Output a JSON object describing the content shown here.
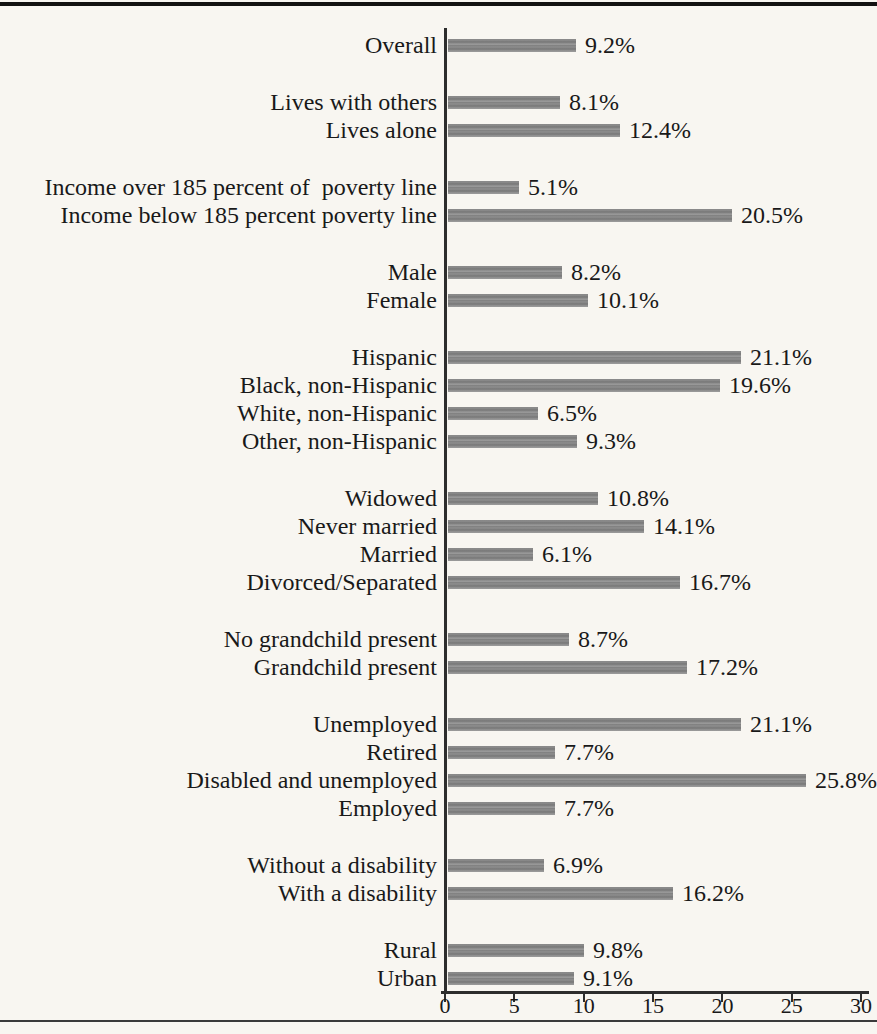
{
  "page": {
    "background_color": "#f8f6f1",
    "text_color": "#191919",
    "has_top_rule": true,
    "has_bottom_rule": true
  },
  "chart_data": {
    "type": "bar",
    "orientation": "horizontal",
    "title": "",
    "xlabel": "",
    "ylabel": "",
    "xlim": [
      0,
      30
    ],
    "x_ticks": [
      "0",
      "5",
      "10",
      "15",
      "20",
      "25",
      "30"
    ],
    "grid": false,
    "legend": false,
    "bar_color": "#7e7e7e",
    "axis_color": "#2d2d2d",
    "value_suffix": "%",
    "groups": [
      {
        "name": "overall",
        "rows": [
          {
            "label": "Overall",
            "value": 9.2,
            "display": "9.2%"
          }
        ]
      },
      {
        "name": "living-arrangement",
        "rows": [
          {
            "label": "Lives with others",
            "value": 8.1,
            "display": "8.1%"
          },
          {
            "label": "Lives alone",
            "value": 12.4,
            "display": "12.4%"
          }
        ]
      },
      {
        "name": "income",
        "rows": [
          {
            "label": "Income over 185 percent of  poverty line",
            "value": 5.1,
            "display": "5.1%"
          },
          {
            "label": "Income below 185 percent poverty line",
            "value": 20.5,
            "display": "20.5%"
          }
        ]
      },
      {
        "name": "sex",
        "rows": [
          {
            "label": "Male",
            "value": 8.2,
            "display": "8.2%"
          },
          {
            "label": "Female",
            "value": 10.1,
            "display": "10.1%"
          }
        ]
      },
      {
        "name": "race-ethnicity",
        "rows": [
          {
            "label": "Hispanic",
            "value": 21.1,
            "display": "21.1%"
          },
          {
            "label": "Black, non-Hispanic",
            "value": 19.6,
            "display": "19.6%"
          },
          {
            "label": "White, non-Hispanic",
            "value": 6.5,
            "display": "6.5%"
          },
          {
            "label": "Other, non-Hispanic",
            "value": 9.3,
            "display": "9.3%"
          }
        ]
      },
      {
        "name": "marital-status",
        "rows": [
          {
            "label": "Widowed",
            "value": 10.8,
            "display": "10.8%"
          },
          {
            "label": "Never married",
            "value": 14.1,
            "display": "14.1%"
          },
          {
            "label": "Married",
            "value": 6.1,
            "display": "6.1%"
          },
          {
            "label": "Divorced/Separated",
            "value": 16.7,
            "display": "16.7%"
          }
        ]
      },
      {
        "name": "grandchild",
        "rows": [
          {
            "label": "No grandchild present",
            "value": 8.7,
            "display": "8.7%"
          },
          {
            "label": "Grandchild present",
            "value": 17.2,
            "display": "17.2%"
          }
        ]
      },
      {
        "name": "employment",
        "rows": [
          {
            "label": "Unemployed",
            "value": 21.1,
            "display": "21.1%"
          },
          {
            "label": "Retired",
            "value": 7.7,
            "display": "7.7%"
          },
          {
            "label": "Disabled and unemployed",
            "value": 25.8,
            "display": "25.8%"
          },
          {
            "label": "Employed",
            "value": 7.7,
            "display": "7.7%"
          }
        ]
      },
      {
        "name": "disability",
        "rows": [
          {
            "label": "Without a disability",
            "value": 6.9,
            "display": "6.9%"
          },
          {
            "label": "With a disability",
            "value": 16.2,
            "display": "16.2%"
          }
        ]
      },
      {
        "name": "urbanicity",
        "rows": [
          {
            "label": "Rural",
            "value": 9.8,
            "display": "9.8%"
          },
          {
            "label": "Urban",
            "value": 9.1,
            "display": "9.1%"
          }
        ]
      }
    ]
  }
}
